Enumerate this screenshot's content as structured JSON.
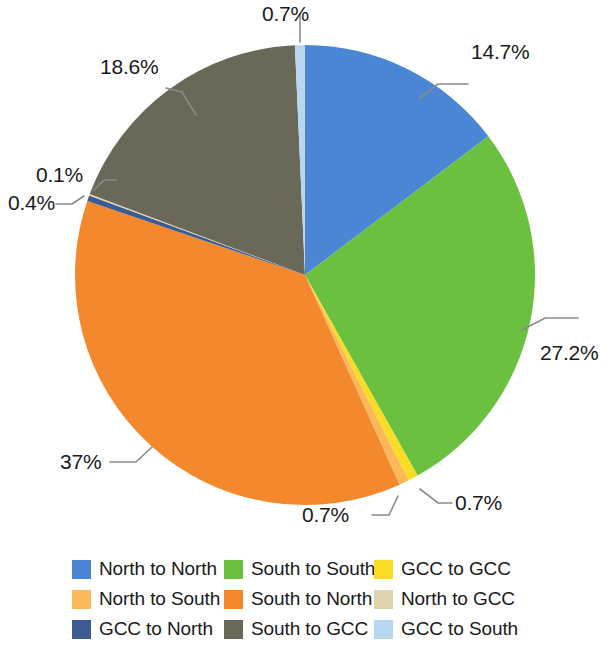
{
  "chart_data": {
    "type": "pie",
    "title": "",
    "subtitle": "",
    "xlabel": "",
    "ylabel": "",
    "legend_position": "bottom",
    "grid": false,
    "start_angle_deg": 0,
    "direction": "clockwise",
    "categories": [
      "North to North",
      "South to South",
      "GCC to GCC",
      "North to South",
      "South to North",
      "GCC to North",
      "North to GCC",
      "South to GCC",
      "GCC to South"
    ],
    "values": [
      14.7,
      27.2,
      0.7,
      0.7,
      37,
      0.4,
      0.1,
      18.6,
      0.7
    ],
    "data_labels": [
      "14.7%",
      "27.2%",
      "0.7%",
      "0.7%",
      "37%",
      "0.4%",
      "0.1%",
      "18.6%",
      "0.7%"
    ],
    "colors": [
      "#4a86d4",
      "#6cc040",
      "#f8dd24",
      "#fcb95a",
      "#f4882c",
      "#3b5b92",
      "#ddd3ac",
      "#6a6858",
      "#b7d7f0"
    ],
    "units": "percent"
  },
  "labels": {
    "north_to_north": "14.7%",
    "south_to_south": "27.2%",
    "gcc_to_gcc": "0.7%",
    "north_to_south": "0.7%",
    "south_to_north": "37%",
    "gcc_to_north": "0.4%",
    "north_to_gcc": "0.1%",
    "south_to_gcc": "18.6%",
    "gcc_to_south": "0.7%"
  },
  "legend": {
    "items": [
      {
        "label": "North to North",
        "color": "#4a86d4"
      },
      {
        "label": "South to South",
        "color": "#6cc040"
      },
      {
        "label": "GCC to GCC",
        "color": "#f8dd24"
      },
      {
        "label": "North to South",
        "color": "#fcb95a"
      },
      {
        "label": "South to North",
        "color": "#f4882c"
      },
      {
        "label": "North to GCC",
        "color": "#ddd3ac"
      },
      {
        "label": "GCC to North",
        "color": "#3b5b92"
      },
      {
        "label": "South to GCC",
        "color": "#6a6858"
      },
      {
        "label": "GCC to South",
        "color": "#b7d7f0"
      }
    ]
  }
}
